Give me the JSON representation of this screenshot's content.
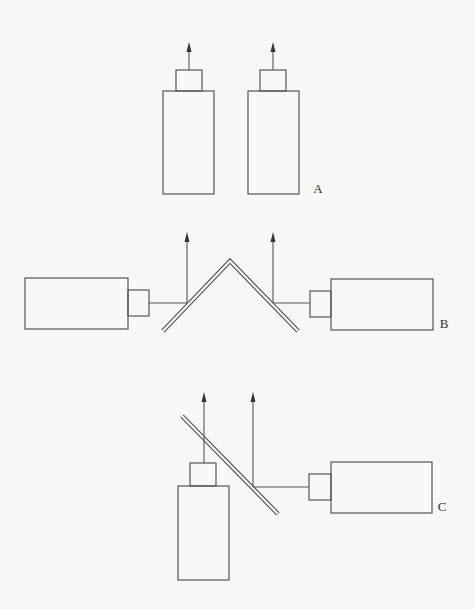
{
  "diagram": {
    "colors": {
      "stroke": "#555555",
      "background": "#f7f7f5",
      "label": "#333333"
    },
    "panels": [
      {
        "label": "A",
        "description": "Two upward-facing cameras side by side",
        "label_pos": [
          318,
          193
        ],
        "cameras": [
          {
            "body": [
              163,
              91,
              51,
              103
            ],
            "lens": [
              176,
              70,
              26,
              21
            ],
            "orientation": "up"
          },
          {
            "body": [
              248,
              91,
              51,
              103
            ],
            "lens": [
              260,
              70,
              26,
              21
            ],
            "orientation": "up"
          }
        ],
        "arrows": [
          {
            "x": 189,
            "y_start": 70,
            "y_end": 42
          },
          {
            "x": 273,
            "y_start": 70,
            "y_end": 42
          }
        ]
      },
      {
        "label": "B",
        "description": "Two horizontal cameras facing an inverted-V mirror, beams redirected upward",
        "label_pos": [
          444,
          328
        ],
        "cameras": [
          {
            "body": [
              25,
              278,
              103,
              51
            ],
            "lens": [
              128,
              290,
              21,
              26
            ],
            "orientation": "right"
          },
          {
            "body": [
              331,
              279,
              102,
              51
            ],
            "lens": [
              310,
              291,
              21,
              26
            ],
            "orientation": "left"
          }
        ],
        "mirror": {
          "points": [
            [
              163,
              331
            ],
            [
              230,
              261
            ],
            [
              298,
              331
            ]
          ]
        },
        "beams": [
          {
            "from": [
              149,
              303
            ],
            "to": [
              187,
              303
            ]
          },
          {
            "from": [
              310,
              303
            ],
            "to": [
              273,
              303
            ]
          }
        ],
        "arrows": [
          {
            "x": 187,
            "y_start": 303,
            "y_end": 232
          },
          {
            "x": 273,
            "y_start": 303,
            "y_end": 232
          }
        ]
      },
      {
        "label": "C",
        "description": "One upward camera and one horizontal camera combined via a diagonal beam-splitter mirror",
        "label_pos": [
          442,
          511
        ],
        "cameras": [
          {
            "body": [
              178,
              486,
              51,
              94
            ],
            "lens": [
              190,
              463,
              26,
              23
            ],
            "orientation": "up"
          },
          {
            "body": [
              331,
              462,
              101,
              51
            ],
            "lens": [
              309,
              474,
              22,
              26
            ],
            "orientation": "left"
          }
        ],
        "mirror": {
          "points": [
            [
              182,
              416
            ],
            [
              278,
              514
            ]
          ]
        },
        "beams": [
          {
            "from": [
              309,
              487
            ],
            "to": [
              253,
              487
            ]
          }
        ],
        "arrows": [
          {
            "x": 204,
            "y_start": 463,
            "y_end": 392
          },
          {
            "x": 253,
            "y_start": 487,
            "y_end": 392
          }
        ]
      }
    ]
  }
}
